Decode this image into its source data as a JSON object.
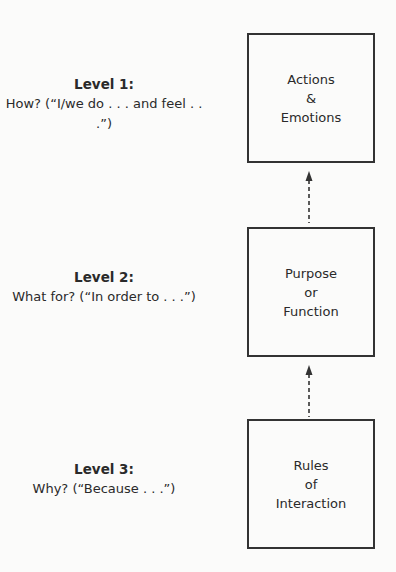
{
  "diagram": {
    "levels": [
      {
        "title": "Level 1:",
        "question": "How? (“I/we do . . . and feel . . .”)"
      },
      {
        "title": "Level 2:",
        "question": "What for? (“In order to . . .”)"
      },
      {
        "title": "Level 3:",
        "question": "Why? (“Because . . .”)"
      }
    ],
    "boxes": [
      {
        "lines": [
          "Actions",
          "&",
          "Emotions"
        ]
      },
      {
        "lines": [
          "Purpose",
          "or",
          "Function"
        ]
      },
      {
        "lines": [
          "Rules",
          "of",
          "Interaction"
        ]
      }
    ],
    "arrows": [
      {
        "from": "Purpose or Function",
        "to": "Actions & Emotions",
        "style": "dashed"
      },
      {
        "from": "Rules of Interaction",
        "to": "Purpose or Function",
        "style": "dashed"
      }
    ],
    "colors": {
      "line": "#333333",
      "text": "#2a2a2a",
      "background": "#fbfbfa"
    }
  }
}
